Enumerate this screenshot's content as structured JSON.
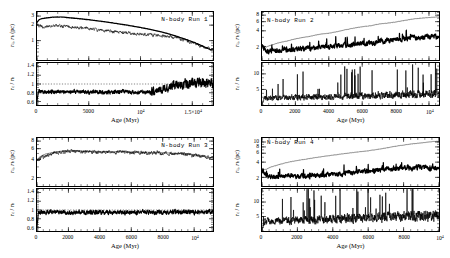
{
  "figure": {
    "background": "#ffffff",
    "ink": "#000000",
    "panel_count": 4
  },
  "common": {
    "xlabel": "Age (Myr)",
    "ylabel_top": "r_c, r_h (pc)",
    "ylabel_bottom": "r_c / r_h",
    "series_names": [
      "r_h",
      "r_c"
    ],
    "ratio_reference_line": 1
  },
  "chart_data": [
    {
      "type": "line",
      "title": "N-body Run 1",
      "panel": "top-left",
      "xlabel": "Age (Myr)",
      "ylabel": "r_c, r_h (pc)",
      "xlim": [
        0,
        17000
      ],
      "xticks": [
        0,
        5000,
        10000,
        15000
      ],
      "xticklabels": [
        "0",
        "5000",
        "10⁴",
        "1.5×10⁴"
      ],
      "yscale": "log",
      "ylim": [
        0.42,
        3.6
      ],
      "yticks": [
        1,
        2,
        3
      ],
      "yticklabels": [
        "1",
        "2",
        "3"
      ],
      "grid": false,
      "legend": "none",
      "series": [
        {
          "name": "r_h",
          "style": "thick",
          "x": [
            0,
            200,
            500,
            1000,
            1500,
            2000,
            2500,
            3000,
            4000,
            5000,
            6000,
            7000,
            8000,
            9000,
            10000,
            11000,
            12000,
            13000,
            14000,
            15000,
            16000,
            16800
          ],
          "values": [
            2.25,
            2.55,
            2.68,
            2.78,
            2.85,
            2.88,
            2.86,
            2.8,
            2.68,
            2.55,
            2.4,
            2.26,
            2.1,
            1.95,
            1.8,
            1.64,
            1.48,
            1.3,
            1.12,
            0.95,
            0.78,
            0.66
          ]
        },
        {
          "name": "r_c",
          "style": "thin-noisy",
          "x": [
            0,
            200,
            500,
            1000,
            1500,
            2000,
            2500,
            3000,
            4000,
            5000,
            6000,
            7000,
            8000,
            9000,
            10000,
            11000,
            12000,
            13000,
            14000,
            15000,
            16000,
            16800
          ],
          "values": [
            2.25,
            1.95,
            1.85,
            1.88,
            1.9,
            1.95,
            1.9,
            1.88,
            1.8,
            1.72,
            1.62,
            1.55,
            1.45,
            1.4,
            1.32,
            1.3,
            1.25,
            1.18,
            1.05,
            0.92,
            0.76,
            0.68
          ]
        }
      ],
      "ratio_panel": {
        "ylabel": "r_c / r_h",
        "ylim": [
          0.52,
          1.48
        ],
        "yticks": [
          0.6,
          0.8,
          1,
          1.2,
          1.4
        ],
        "yticklabels": [
          "0.6",
          "0.8",
          "1",
          "1.2",
          "1.4"
        ],
        "reference_line": 1,
        "mean_level": 0.82,
        "late_rise_from": 11000,
        "late_level": 1.02
      }
    },
    {
      "type": "line",
      "title": "N-body Run 2",
      "panel": "top-right",
      "xlabel": "Age (Myr)",
      "ylabel": "r_c, r_h (pc)",
      "xlim": [
        0,
        10600
      ],
      "xticks": [
        0,
        2000,
        4000,
        6000,
        8000,
        10000
      ],
      "xticklabels": [
        "0",
        "2000",
        "4000",
        "6000",
        "8000",
        "10⁴"
      ],
      "yscale": "log",
      "ylim": [
        1.1,
        9.2
      ],
      "yticks": [
        2,
        4,
        6,
        8
      ],
      "yticklabels": [
        "2",
        "4",
        "6",
        "8"
      ],
      "grid": false,
      "legend": "none",
      "series": [
        {
          "name": "r_h",
          "style": "thin",
          "x": [
            0,
            250,
            500,
            1000,
            1500,
            2000,
            2500,
            3000,
            3500,
            4000,
            4500,
            5000,
            5500,
            6000,
            6500,
            7000,
            7500,
            8000,
            8500,
            9000,
            9500,
            10000,
            10500
          ],
          "values": [
            2.15,
            1.95,
            2.1,
            2.35,
            2.55,
            2.8,
            3.0,
            3.2,
            3.45,
            3.6,
            3.85,
            4.2,
            4.5,
            4.8,
            5.0,
            5.4,
            5.6,
            5.9,
            6.3,
            6.7,
            7.0,
            7.2,
            7.4
          ]
        },
        {
          "name": "r_c",
          "style": "thick-noisy",
          "x": [
            0,
            250,
            500,
            1000,
            1500,
            2000,
            2500,
            3000,
            3500,
            4000,
            4500,
            5000,
            5500,
            6000,
            6500,
            7000,
            7500,
            8000,
            8500,
            9000,
            9500,
            10000,
            10500
          ],
          "values": [
            2.15,
            1.7,
            1.65,
            1.7,
            1.72,
            1.8,
            1.85,
            1.9,
            1.95,
            2.0,
            2.05,
            2.15,
            2.2,
            2.3,
            2.4,
            2.5,
            2.6,
            2.75,
            2.85,
            2.95,
            3.0,
            3.1,
            3.1
          ]
        }
      ],
      "ratio_panel": {
        "ylabel": "r_c / r_h",
        "ylim": [
          0,
          13.5
        ],
        "yticks": [
          5,
          10
        ],
        "yticklabels": [
          "5",
          "10"
        ],
        "baseline_level": 3.0,
        "spike_count": 42,
        "max_spike": 13
      }
    },
    {
      "type": "line",
      "title": "N-body Run 3",
      "panel": "bottom-left",
      "xlabel": "Age (Myr)",
      "ylabel": "r_c, r_h (pc)",
      "xlim": [
        0,
        11200
      ],
      "xticks": [
        0,
        2000,
        4000,
        6000,
        8000,
        10000
      ],
      "xticklabels": [
        "0",
        "2000",
        "4000",
        "6000",
        "8000",
        "10⁴"
      ],
      "yscale": "log",
      "ylim": [
        1.45,
        9.0
      ],
      "yticks": [
        2,
        4,
        6,
        8
      ],
      "yticklabels": [
        "2",
        "4",
        "6",
        "8"
      ],
      "grid": false,
      "legend": "none",
      "series": [
        {
          "name": "r_h",
          "style": "thin",
          "x": [
            0,
            200,
            500,
            1000,
            1500,
            2000,
            2500,
            3000,
            3500,
            4000,
            5000,
            6000,
            7000,
            8000,
            9000,
            10000,
            10500,
            11000
          ],
          "values": [
            3.9,
            4.45,
            4.85,
            5.2,
            5.45,
            5.55,
            5.5,
            5.45,
            5.45,
            5.4,
            5.35,
            5.3,
            5.25,
            5.15,
            5.0,
            4.8,
            4.6,
            4.3
          ]
        },
        {
          "name": "r_c",
          "style": "thin-noisy",
          "x": [
            0,
            200,
            500,
            1000,
            1500,
            2000,
            2500,
            3000,
            3500,
            4000,
            5000,
            6000,
            7000,
            8000,
            9000,
            10000,
            10500,
            11000
          ],
          "values": [
            3.9,
            4.1,
            4.55,
            5.0,
            5.3,
            5.45,
            5.4,
            5.3,
            5.35,
            5.3,
            5.25,
            5.2,
            5.15,
            5.05,
            4.9,
            4.7,
            4.5,
            4.25
          ]
        }
      ],
      "ratio_panel": {
        "ylabel": "r_c / r_h",
        "ylim": [
          0.52,
          1.48
        ],
        "yticks": [
          0.6,
          0.8,
          1,
          1.2,
          1.4
        ],
        "yticklabels": [
          "0.6",
          "0.8",
          "1",
          "1.2",
          "1.4"
        ],
        "reference_line": 1,
        "mean_level": 0.95
      }
    },
    {
      "type": "line",
      "title": "N-body Run 4",
      "panel": "bottom-right",
      "xlabel": "Age (Myr)",
      "ylabel": "r_c, r_h (pc)",
      "xlim": [
        0,
        10000
      ],
      "xticks": [
        0,
        2000,
        4000,
        6000,
        8000,
        10000
      ],
      "xticklabels": [
        "0",
        "2000",
        "4000",
        "6000",
        "8000",
        "10⁴"
      ],
      "yscale": "log",
      "ylim": [
        1.35,
        12.0
      ],
      "yticks": [
        2,
        4,
        6,
        8,
        10
      ],
      "yticklabels": [
        "2",
        "4",
        "6",
        "8",
        "10"
      ],
      "grid": false,
      "legend": "none",
      "series": [
        {
          "name": "r_h",
          "style": "thin",
          "x": [
            0,
            250,
            500,
            1000,
            1500,
            2000,
            2500,
            3000,
            3500,
            4000,
            4500,
            5000,
            5500,
            6000,
            6500,
            7000,
            7500,
            8000,
            8500,
            9000,
            9500,
            10000
          ],
          "values": [
            2.8,
            2.9,
            3.2,
            3.6,
            4.0,
            4.3,
            4.6,
            4.9,
            5.2,
            5.5,
            5.8,
            6.1,
            6.4,
            6.7,
            7.1,
            7.6,
            8.2,
            8.7,
            9.2,
            9.6,
            10.1,
            10.4
          ]
        },
        {
          "name": "r_c",
          "style": "thick-noisy",
          "x": [
            0,
            250,
            500,
            1000,
            1500,
            2000,
            2500,
            3000,
            3500,
            4000,
            4500,
            5000,
            5500,
            6000,
            6500,
            7000,
            7500,
            8000,
            8500,
            9000,
            9500,
            10000
          ],
          "values": [
            2.8,
            2.2,
            2.0,
            2.05,
            2.1,
            2.1,
            2.15,
            2.2,
            2.3,
            2.35,
            2.4,
            2.5,
            2.6,
            2.7,
            2.8,
            2.9,
            3.0,
            3.1,
            3.15,
            3.2,
            3.1,
            2.9
          ]
        }
      ],
      "ratio_panel": {
        "ylabel": "r_c / r_h",
        "ylim": [
          0,
          14.5
        ],
        "yticks": [
          5,
          10
        ],
        "yticklabels": [
          "5",
          "10"
        ],
        "baseline_level": 4.5,
        "spike_count": 55,
        "max_spike": 14
      }
    }
  ]
}
